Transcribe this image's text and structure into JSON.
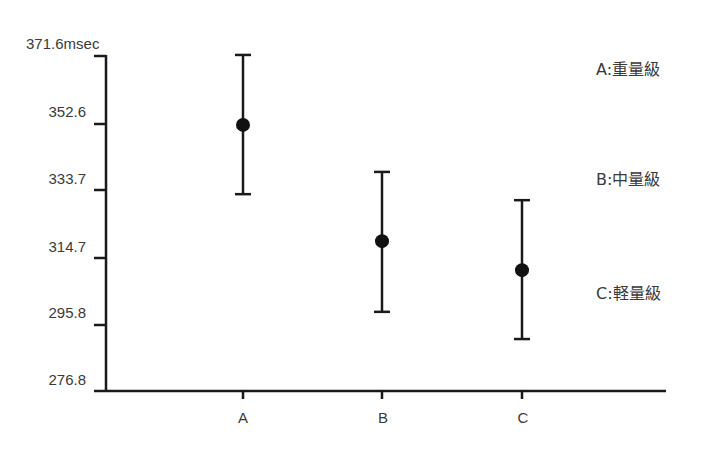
{
  "chart_data": {
    "type": "errorbar",
    "title": "",
    "xlabel": "",
    "ylabel": "msec",
    "y_unit": "msec",
    "categories": [
      "A",
      "B",
      "C"
    ],
    "series": [
      {
        "name": "mean ± error",
        "values": [
          352.1,
          319.2,
          311.0
        ],
        "upper": [
          371.9,
          338.8,
          330.8
        ],
        "lower": [
          332.5,
          299.2,
          291.5
        ]
      }
    ],
    "yticks": [
      "371.6",
      "352.6",
      "333.7",
      "314.7",
      "295.8",
      "276.8"
    ],
    "ylim": [
      276.8,
      371.6
    ],
    "grid": false,
    "legend": {
      "position": "right",
      "entries": [
        "A:重量級",
        "B:中量級",
        "C:軽量級"
      ]
    }
  },
  "axis": {
    "y_top_label": "371.6",
    "y_unit": "msec",
    "y_labels": [
      "352.6",
      "333.7",
      "314.7",
      "295.8",
      "276.8"
    ],
    "x_labels": [
      "A",
      "B",
      "C"
    ]
  },
  "legend": [
    "A:重量級",
    "B:中量級",
    "C:軽量級"
  ],
  "colors": {
    "axis": "#1a1a1a",
    "marker": "#111111",
    "text": "#3a3a3a"
  }
}
